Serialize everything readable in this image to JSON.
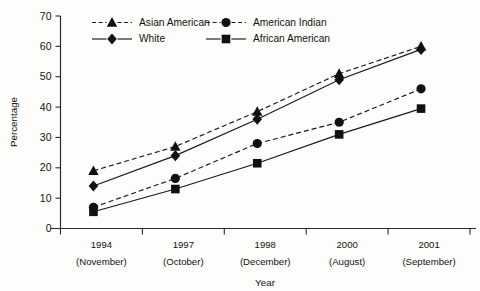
{
  "chart_data": {
    "type": "line",
    "title": "",
    "xlabel": "Year",
    "ylabel": "Percentage",
    "ylim": [
      0,
      70
    ],
    "ytick_step": 10,
    "yticks": [
      0,
      10,
      20,
      30,
      40,
      50,
      60,
      70
    ],
    "grid": false,
    "legend_position": "top-left-inside",
    "categories": [
      {
        "year": "1994",
        "month": "(November)"
      },
      {
        "year": "1997",
        "month": "(October)"
      },
      {
        "year": "1998",
        "month": "(December)"
      },
      {
        "year": "2000",
        "month": "(August)"
      },
      {
        "year": "2001",
        "month": "(September)"
      }
    ],
    "series": [
      {
        "name": "Asian American",
        "marker": "triangle",
        "linestyle": "dashed",
        "color": "#101010",
        "values": [
          19,
          27,
          38.5,
          51,
          60
        ]
      },
      {
        "name": "White",
        "marker": "diamond",
        "linestyle": "solid",
        "color": "#101010",
        "values": [
          14,
          24,
          36,
          49,
          59
        ]
      },
      {
        "name": "American Indian",
        "marker": "circle",
        "linestyle": "dashed",
        "color": "#101010",
        "values": [
          7,
          16.5,
          28,
          35,
          46
        ]
      },
      {
        "name": "African American",
        "marker": "square",
        "linestyle": "solid",
        "color": "#101010",
        "values": [
          5.5,
          13,
          21.5,
          31,
          39.5
        ]
      }
    ]
  },
  "axes": {
    "y_title": "Percentage",
    "x_title": "Year",
    "y_tick_labels": [
      "70",
      "60",
      "50",
      "40",
      "30",
      "20",
      "10",
      "0"
    ]
  },
  "legend": {
    "entries": [
      {
        "label": "Asian American",
        "marker": "triangle",
        "linestyle": "dashed"
      },
      {
        "label": "American Indian",
        "marker": "circle",
        "linestyle": "dashed"
      },
      {
        "label": "White",
        "marker": "diamond",
        "linestyle": "solid"
      },
      {
        "label": "African American",
        "marker": "square",
        "linestyle": "solid"
      }
    ]
  }
}
